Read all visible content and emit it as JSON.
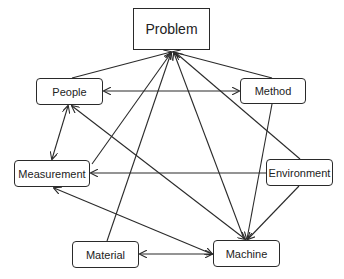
{
  "diagram": {
    "type": "cause-effect-network",
    "nodes": {
      "problem": {
        "label": "Problem",
        "x": 133,
        "y": 8,
        "w": 77,
        "h": 42
      },
      "people": {
        "label": "People",
        "x": 36,
        "y": 78,
        "w": 67,
        "h": 27
      },
      "method": {
        "label": "Method",
        "x": 240,
        "y": 78,
        "w": 66,
        "h": 26
      },
      "measurement": {
        "label": "Measurement",
        "x": 14,
        "y": 160,
        "w": 76,
        "h": 27
      },
      "environment": {
        "label": "Environment",
        "x": 266,
        "y": 159,
        "w": 67,
        "h": 27
      },
      "material": {
        "label": "Material",
        "x": 72,
        "y": 241,
        "w": 67,
        "h": 27
      },
      "machine": {
        "label": "Machine",
        "x": 213,
        "y": 240,
        "w": 67,
        "h": 27
      }
    },
    "edges": [
      {
        "from": "People",
        "to": "Problem",
        "direction": "forward"
      },
      {
        "from": "Method",
        "to": "Problem",
        "direction": "forward"
      },
      {
        "from": "Measurement",
        "to": "Problem",
        "direction": "forward"
      },
      {
        "from": "Material",
        "to": "Problem",
        "direction": "forward"
      },
      {
        "from": "Machine",
        "to": "Problem",
        "direction": "forward"
      },
      {
        "from": "Environment",
        "to": "Problem",
        "direction": "forward"
      },
      {
        "from": "People",
        "to": "Method",
        "direction": "both"
      },
      {
        "from": "People",
        "to": "Measurement",
        "direction": "both"
      },
      {
        "from": "People",
        "to": "Machine",
        "direction": "both"
      },
      {
        "from": "Method",
        "to": "Machine",
        "direction": "forward"
      },
      {
        "from": "Environment",
        "to": "Measurement",
        "direction": "forward"
      },
      {
        "from": "Environment",
        "to": "Machine",
        "direction": "forward"
      },
      {
        "from": "Measurement",
        "to": "Machine",
        "direction": "both"
      },
      {
        "from": "Material",
        "to": "Machine",
        "direction": "both"
      }
    ]
  }
}
